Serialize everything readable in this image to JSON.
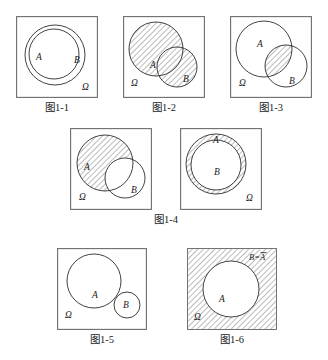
{
  "page": {
    "background_color": "#ffffff",
    "frame_color": "#6d6d6d",
    "circle_color": "#2b2b2b",
    "hatch_color": "#555555"
  },
  "figures": [
    {
      "id": "fig-1-1",
      "caption": "图1-1",
      "meaning": "A is a subset of B (A ⊂ B)",
      "shading": "none",
      "labels": {
        "a": "A",
        "b": "B",
        "omega": "Ω"
      }
    },
    {
      "id": "fig-1-2",
      "caption": "图1-2",
      "meaning": "Union of A and B (A ∪ B) shaded",
      "shading": "union",
      "labels": {
        "a": "A",
        "b": "B",
        "omega": "Ω"
      }
    },
    {
      "id": "fig-1-3",
      "caption": "图1-3",
      "meaning": "Intersection of A and B (A ∩ B) shaded",
      "shading": "intersection",
      "labels": {
        "a": "A",
        "b": "B",
        "omega": "Ω"
      }
    },
    {
      "id": "fig-1-4-left",
      "caption": "图1-4",
      "meaning": "Difference A minus B (A − B) shaded",
      "shading": "difference",
      "labels": {
        "a": "A",
        "b": "B",
        "omega": "Ω"
      }
    },
    {
      "id": "fig-1-4-right",
      "caption": "",
      "meaning": "Annulus A minus B with B inside A shaded",
      "shading": "annulus",
      "labels": {
        "a": "A",
        "b": "B",
        "omega": "Ω"
      }
    },
    {
      "id": "fig-1-5",
      "caption": "图1-5",
      "meaning": "A and B are mutually exclusive (disjoint)",
      "shading": "none",
      "labels": {
        "a": "A",
        "b": "B",
        "omega": "Ω"
      }
    },
    {
      "id": "fig-1-6",
      "caption": "图1-6",
      "meaning": "Complement of A shaded, B equals complement of A",
      "shading": "complement",
      "labels": {
        "a": "A",
        "omega": "Ω",
        "complement": "B=A"
      }
    }
  ],
  "captions": {
    "c1": "图1-1",
    "c2": "图1-2",
    "c3": "图1-3",
    "c4": "图1-4",
    "c5": "图1-5",
    "c6": "图1-6"
  }
}
